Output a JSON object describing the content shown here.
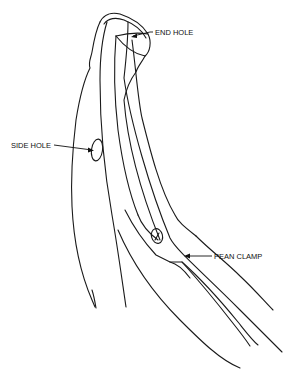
{
  "title": {
    "text_visible_clipped": ""
  },
  "diagram": {
    "labels": {
      "end_hole": "END HOLE",
      "side_hole": "SIDE HOLE",
      "pean_clamp": "PEAN CLAMP"
    },
    "colors": {
      "line": "#1a1a1a",
      "background": "#ffffff"
    }
  }
}
